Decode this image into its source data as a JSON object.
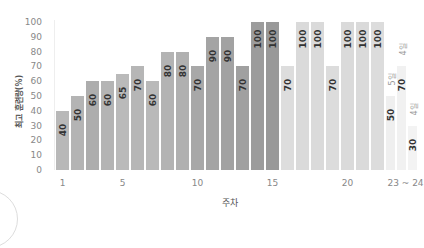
{
  "chart_data": {
    "type": "bar",
    "title": "",
    "xlabel": "주차",
    "ylabel": "최고 훈련량(%)",
    "ylim": [
      0,
      100
    ],
    "yticks": [
      0,
      10,
      20,
      30,
      40,
      50,
      60,
      70,
      80,
      90,
      100
    ],
    "xtick_labels": [
      {
        "label": "1",
        "at": 1
      },
      {
        "label": "5",
        "at": 5
      },
      {
        "label": "10",
        "at": 10
      },
      {
        "label": "15",
        "at": 15
      },
      {
        "label": "20",
        "at": 20
      },
      {
        "label": "23 ~ 24",
        "at": 23.5
      }
    ],
    "grid": false,
    "categories": [
      "1",
      "2",
      "3",
      "4",
      "5",
      "6",
      "7",
      "8",
      "9",
      "10",
      "11",
      "12",
      "13",
      "14",
      "15",
      "16",
      "17",
      "18",
      "19",
      "20",
      "21",
      "22",
      "23~24 (1)",
      "23~24 (2)",
      "23~24 (3)"
    ],
    "values": [
      40,
      50,
      60,
      60,
      65,
      70,
      60,
      80,
      80,
      70,
      90,
      90,
      70,
      100,
      100,
      70,
      100,
      100,
      70,
      100,
      100,
      100,
      50,
      70,
      30
    ],
    "annotations": [
      {
        "bar_index": 22,
        "text": "5일"
      },
      {
        "bar_index": 23,
        "text": "4일"
      },
      {
        "bar_index": 24,
        "text": "4일"
      }
    ],
    "colors": [
      "#b8b8b8",
      "#b4b4b4",
      "#adadad",
      "#b4b4b4",
      "#bababa",
      "#b6b6b6",
      "#b9b9b9",
      "#b3b3b3",
      "#b0b0b0",
      "#a8a8a8",
      "#a4a4a4",
      "#a2a2a2",
      "#a0a0a0",
      "#9c9c9c",
      "#999999",
      "#dddddd",
      "#dadada",
      "#dadada",
      "#dcdcdc",
      "#dadada",
      "#dadada",
      "#dcdcdc",
      "#efefef",
      "#f1f1f1",
      "#f3f3f3"
    ]
  }
}
